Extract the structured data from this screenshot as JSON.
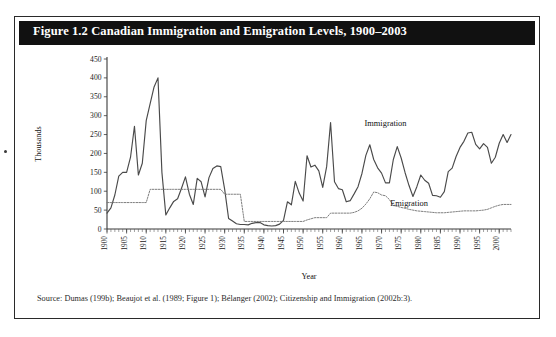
{
  "figure": {
    "title": "Figure 1.2 Canadian Immigration and Emigration Levels, 1900–2003",
    "source": "Source: Dumas (199b); Beaujot et al. (1989; Figure 1); Bélanger (2002); Citizenship and Immigration (2002b:3).",
    "title_bar_color": "#111111",
    "title_text_color": "#ffffff",
    "border_color": "#2a2a2a"
  },
  "chart_data": {
    "type": "line",
    "title": "Canadian Immigration and Emigration Levels, 1900–2003",
    "xlabel": "Year",
    "ylabel": "Thousands",
    "xlim": [
      1900,
      2003
    ],
    "ylim": [
      0,
      450
    ],
    "yticks": [
      0,
      50,
      100,
      150,
      200,
      250,
      300,
      350,
      400,
      450
    ],
    "xticks": [
      1900,
      1905,
      1910,
      1915,
      1920,
      1925,
      1930,
      1935,
      1940,
      1945,
      1950,
      1955,
      1960,
      1965,
      1970,
      1975,
      1980,
      1985,
      1990,
      1995,
      2000
    ],
    "xtick_minor_step": 1,
    "grid": false,
    "legend_position": "inline-annotation",
    "series": [
      {
        "name": "Immigration",
        "style": "solid",
        "color": "#4a4a4a",
        "label_x": 1971,
        "label_y": 272,
        "x": [
          1900,
          1901,
          1902,
          1903,
          1904,
          1905,
          1906,
          1907,
          1908,
          1909,
          1910,
          1911,
          1912,
          1913,
          1914,
          1915,
          1916,
          1917,
          1918,
          1919,
          1920,
          1921,
          1922,
          1923,
          1924,
          1925,
          1926,
          1927,
          1928,
          1929,
          1930,
          1931,
          1932,
          1933,
          1934,
          1935,
          1936,
          1937,
          1938,
          1939,
          1940,
          1941,
          1942,
          1943,
          1944,
          1945,
          1946,
          1947,
          1948,
          1949,
          1950,
          1951,
          1952,
          1953,
          1954,
          1955,
          1956,
          1957,
          1958,
          1959,
          1960,
          1961,
          1962,
          1963,
          1964,
          1965,
          1966,
          1967,
          1968,
          1969,
          1970,
          1971,
          1972,
          1973,
          1974,
          1975,
          1976,
          1977,
          1978,
          1979,
          1980,
          1981,
          1982,
          1983,
          1984,
          1985,
          1986,
          1987,
          1988,
          1989,
          1990,
          1991,
          1992,
          1993,
          1994,
          1995,
          1996,
          1997,
          1998,
          1999,
          2000,
          2001,
          2002,
          2003
        ],
        "y": [
          42,
          56,
          90,
          140,
          150,
          150,
          190,
          272,
          143,
          174,
          287,
          332,
          376,
          400,
          150,
          37,
          56,
          73,
          80,
          108,
          138,
          92,
          65,
          134,
          125,
          85,
          136,
          160,
          167,
          165,
          105,
          28,
          21,
          14,
          12,
          12,
          11,
          15,
          17,
          17,
          11,
          9,
          8,
          9,
          13,
          23,
          72,
          64,
          126,
          95,
          74,
          194,
          164,
          169,
          154,
          110,
          165,
          282,
          125,
          107,
          104,
          72,
          75,
          93,
          112,
          147,
          195,
          223,
          184,
          162,
          148,
          122,
          122,
          184,
          218,
          188,
          149,
          115,
          86,
          112,
          143,
          129,
          121,
          89,
          88,
          84,
          99,
          152,
          161,
          192,
          216,
          232,
          254,
          256,
          224,
          212,
          226,
          216,
          174,
          190,
          227,
          250,
          229,
          250
        ]
      },
      {
        "name": "Emigration",
        "style": "dotted",
        "color": "#777777",
        "label_x": 1977,
        "label_y": 62,
        "x": [
          1900,
          1901,
          1902,
          1903,
          1904,
          1905,
          1906,
          1907,
          1908,
          1909,
          1910,
          1911,
          1912,
          1913,
          1914,
          1915,
          1916,
          1917,
          1918,
          1919,
          1920,
          1921,
          1922,
          1923,
          1924,
          1925,
          1926,
          1927,
          1928,
          1929,
          1930,
          1931,
          1932,
          1933,
          1934,
          1935,
          1936,
          1937,
          1938,
          1939,
          1940,
          1941,
          1942,
          1943,
          1944,
          1945,
          1946,
          1947,
          1948,
          1949,
          1950,
          1951,
          1952,
          1953,
          1954,
          1955,
          1956,
          1957,
          1958,
          1959,
          1960,
          1961,
          1962,
          1963,
          1964,
          1965,
          1966,
          1967,
          1968,
          1969,
          1970,
          1971,
          1972,
          1973,
          1974,
          1975,
          1976,
          1977,
          1978,
          1979,
          1980,
          1981,
          1982,
          1983,
          1984,
          1985,
          1986,
          1987,
          1988,
          1989,
          1990,
          1991,
          1992,
          1993,
          1994,
          1995,
          1996,
          1997,
          1998,
          1999,
          2000,
          2001,
          2002,
          2003
        ],
        "y": [
          70,
          70,
          70,
          70,
          70,
          70,
          70,
          70,
          70,
          70,
          70,
          105,
          105,
          105,
          105,
          105,
          105,
          105,
          105,
          105,
          105,
          105,
          105,
          105,
          105,
          105,
          105,
          105,
          105,
          105,
          92,
          92,
          92,
          92,
          92,
          20,
          20,
          20,
          20,
          20,
          20,
          20,
          20,
          20,
          20,
          20,
          20,
          20,
          20,
          20,
          20,
          24,
          27,
          30,
          30,
          30,
          30,
          42,
          42,
          42,
          42,
          42,
          42,
          44,
          48,
          55,
          66,
          80,
          98,
          96,
          90,
          88,
          78,
          62,
          60,
          57,
          55,
          52,
          50,
          48,
          47,
          46,
          45,
          44,
          43,
          43,
          43,
          44,
          45,
          46,
          47,
          48,
          48,
          48,
          48,
          49,
          50,
          52,
          56,
          60,
          63,
          65,
          65,
          65
        ]
      }
    ]
  }
}
